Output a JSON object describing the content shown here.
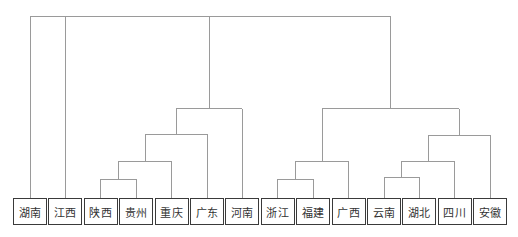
{
  "diagram": {
    "type": "dendrogram",
    "orientation": "top-down",
    "colors": {
      "link": "#9a9a9a",
      "box_border": "#3a3a3a",
      "text": "#333333"
    },
    "leaves": [
      "湖南",
      "江西",
      "陕西",
      "贵州",
      "重庆",
      "广东",
      "河南",
      "浙江",
      "福建",
      "广西",
      "云南",
      "湖北",
      "四川",
      "安徽"
    ],
    "merges": [
      {
        "id": "n1",
        "children": [
          "陕西",
          "贵州"
        ],
        "height": 10.4
      },
      {
        "id": "n2",
        "children": [
          "n1",
          "重庆"
        ],
        "height": 20.3
      },
      {
        "id": "n3",
        "children": [
          "n2",
          "广东"
        ],
        "height": 35
      },
      {
        "id": "n4",
        "children": [
          "n3",
          "河南"
        ],
        "height": 49
      },
      {
        "id": "n5",
        "children": [
          "浙江",
          "福建"
        ],
        "height": 10.4
      },
      {
        "id": "n6",
        "children": [
          "n5",
          "广西"
        ],
        "height": 20.3
      },
      {
        "id": "n7",
        "children": [
          "云南",
          "湖北"
        ],
        "height": 11.5
      },
      {
        "id": "n8",
        "children": [
          "n7",
          "四川"
        ],
        "height": 20.3
      },
      {
        "id": "n9",
        "children": [
          "n8",
          "安徽"
        ],
        "height": 34.5
      },
      {
        "id": "n10",
        "children": [
          "n6",
          "n9"
        ],
        "height": 49
      },
      {
        "id": "root",
        "children": [
          "湖南",
          "江西",
          "n4",
          "n10"
        ],
        "height": 100
      }
    ],
    "max_height": 100
  }
}
